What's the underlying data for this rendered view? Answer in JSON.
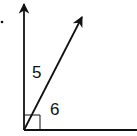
{
  "diagram": {
    "type": "angle-diagram",
    "angles": [
      {
        "id": "angle-5",
        "label": "5"
      },
      {
        "id": "angle-6",
        "label": "6"
      }
    ],
    "right_angle_marker": true,
    "rays": [
      "vertical-ray",
      "diagonal-ray",
      "horizontal-ray"
    ],
    "colors": {
      "stroke": "#111111",
      "background": "#ffffff"
    }
  }
}
